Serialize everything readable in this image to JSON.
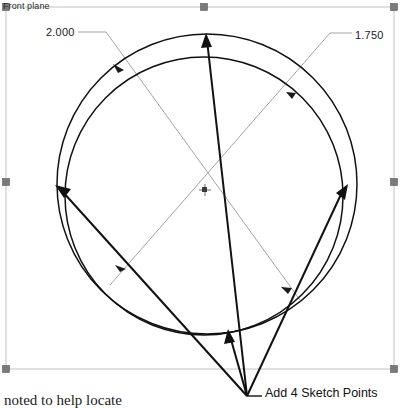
{
  "canvas": {
    "width": 402,
    "height": 408,
    "background": "#ffffff"
  },
  "plane": {
    "label": "Front plane",
    "frame_color": "#b8b8b8",
    "handle_color": "#6e6e6e"
  },
  "dimensions": [
    {
      "name": "outer-circle-diameter",
      "value": "2.000",
      "leader_color": "#9a9a9a"
    },
    {
      "name": "inner-circle-diameter",
      "value": "1.750",
      "leader_color": "#9a9a9a"
    }
  ],
  "annotations": [
    {
      "name": "sketch-points-note",
      "text": "Add 4 Sketch Points"
    },
    {
      "name": "locate-note",
      "text": "noted to help locate"
    }
  ],
  "geometry": {
    "outer_circle": {
      "cx": 207,
      "cy": 184,
      "r": 150,
      "stroke": "#111111"
    },
    "inner_circle": {
      "cx": 204,
      "cy": 196,
      "r": 139,
      "stroke": "#111111"
    },
    "center_marker": {
      "x": 205,
      "y": 190
    },
    "convergence_point": {
      "x": 247,
      "y": 396
    },
    "arrow_stroke": "#111111",
    "arrow_tips": [
      {
        "name": "arrow-top",
        "x": 206,
        "y": 34
      },
      {
        "name": "arrow-left",
        "x": 55,
        "y": 185
      },
      {
        "name": "arrow-right",
        "x": 348,
        "y": 184
      },
      {
        "name": "arrow-lower-left",
        "x": 228,
        "y": 330
      }
    ]
  },
  "colors": {
    "line_dark": "#111111",
    "line_gray": "#9a9a9a",
    "frame": "#b8b8b8",
    "text": "#111111"
  }
}
